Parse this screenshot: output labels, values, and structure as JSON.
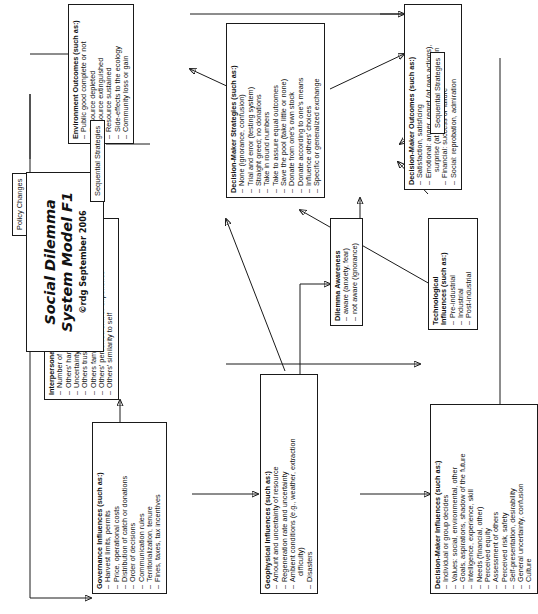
{
  "title_block": {
    "line1": "Social Dilemma",
    "line2": "System Model F1",
    "credit": "©rdg September 2006"
  },
  "labels": {
    "policy_changes": "Policy Changes",
    "sequential_strategies_top": "Sequential Strategies",
    "sequential_strategies_bottom": "Sequential Strategies"
  },
  "boxes": {
    "governance": {
      "header": "Governance Influences (such as:)",
      "items": [
        "Harvest limits, permits",
        "Price, operational costs",
        "Distribution of catch or donations",
        "Order of decisions",
        "Communication rules",
        "Territorialization, tenure",
        "Fines, taxes, tax incentives"
      ]
    },
    "interpersonal": {
      "header": "Interpersonal Influences (such as:)",
      "items": [
        "Number of others, scale of groups",
        "Others' harvest or donation amounts",
        "Uncertainty about others' choices",
        "Others trusted, liked, admired or not",
        "Others familiar or unknown",
        "Others' perceived skill or experience",
        "Others' similarity to self"
      ]
    },
    "geophysical": {
      "header": "Geophysical Influences (such as:)",
      "items": [
        "Amount and uncertainty of resource",
        "Regeneration rate and uncertainty",
        "Ambient conditions (e.g., weather, extraction",
        "difficulty)",
        "Disasters"
      ],
      "continuation_index": 3
    },
    "decision_maker_influences": {
      "header": "Decision-Maker Influences (such as:)",
      "items": [
        "Individual or group decides",
        "Values: social, environmental, other",
        "Goals, aspirations, shadow of the future",
        "Intelligence, experience, skill",
        "Needs (financial, other)",
        "Perceived equity",
        "Assessment of others",
        "Perceived risk, safety",
        "Self-presentation, desirability",
        "General uncertainty, confusion",
        "Culture"
      ]
    },
    "technological": {
      "header_line1": "Technological",
      "header_line2": "Influences (such as:)",
      "items": [
        "Pre-industrial",
        "Industrial",
        "Post-industrial"
      ]
    },
    "dilemma_awareness": {
      "header": "Dilemma Awareness",
      "items": [
        "aware (anxiety, fear)",
        "not aware (ignorance)"
      ]
    },
    "decision_maker_strategies": {
      "header": "Decision-Maker Strategies  (such as:)",
      "items": [
        "None (ignorance, confusion)",
        "Trial and error (testing system)",
        "Straight greed; no donations",
        "Take in round numbers",
        "Take to assure equal outcomes",
        "Save the pool (take little or none)",
        "Donate from one's own stock",
        "Donate according to one's means",
        "Influence others' choices",
        "Specific or generalized exchange"
      ]
    },
    "environment_outcomes": {
      "header": "Environment Outcomes  (such as:)",
      "items": [
        "Public good complete or not",
        "Resource depleted",
        "Resource extinguished",
        "Resource sustained",
        "Side-effects to the ecology",
        "Community loss or gain"
      ]
    },
    "decision_maker_outcomes": {
      "header": "Decision-Maker Outcomes (such as:)",
      "items": [
        "Satisfaction, satisficing",
        "Emotional: anger, regret (at own actions),",
        "surprise (at  others' actions), frustration",
        "Financial: success or failure",
        "Social: reprobation, admiration"
      ],
      "continuation_index": 2
    }
  }
}
